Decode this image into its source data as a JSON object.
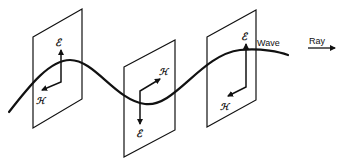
{
  "diagram": {
    "title": "",
    "labels": {
      "wave": "Wave",
      "ray": "Ray",
      "e_field": "ℰ",
      "h_field": "ℋ"
    },
    "planes": [
      {
        "name": "plane-1",
        "e_direction": "up",
        "h_direction": "back-left"
      },
      {
        "name": "plane-2",
        "e_direction": "down",
        "h_direction": "forward-right"
      },
      {
        "name": "plane-3",
        "e_direction": "up",
        "h_direction": "back-left"
      }
    ],
    "colors": {
      "stroke": "#111111",
      "background": "#ffffff"
    }
  }
}
